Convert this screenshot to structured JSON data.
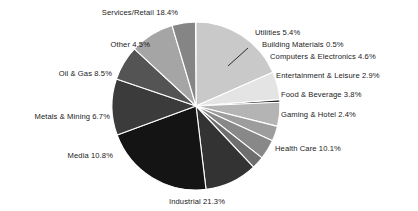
{
  "chart_data": {
    "type": "pie",
    "title": "",
    "subtitle": "",
    "xlabel": "",
    "ylabel": "",
    "legend_position": "none",
    "grid": false,
    "units": "percent",
    "total": 100.0,
    "categories": [
      "Services/Retail",
      "Utilities",
      "Building Materials",
      "Computers & Electronics",
      "Entertainment & Leisure",
      "Food & Beverage",
      "Gaming & Hotel",
      "Health Care",
      "Industrial",
      "Media",
      "Metals & Mining",
      "Oil & Gas",
      "Other"
    ],
    "values": [
      18.4,
      5.4,
      0.5,
      4.6,
      2.9,
      3.8,
      2.4,
      10.1,
      21.3,
      10.8,
      6.7,
      8.5,
      4.5
    ],
    "slices": [
      {
        "name": "Services/Retail",
        "value": 18.4,
        "label": "Services/Retail 18.4%",
        "color": "#c9c9c9",
        "start_angle": 0.0,
        "end_angle": 66.24,
        "label_x": 140,
        "label_y": 9,
        "label_align": "center",
        "leader": false
      },
      {
        "name": "Utilities",
        "value": 5.4,
        "label": "Utilities 5.4%",
        "color": "#e4e4e4",
        "start_angle": 66.24,
        "end_angle": 85.68,
        "label_x": 255,
        "label_y": 29,
        "label_align": "left",
        "leader": false
      },
      {
        "name": "Building Materials",
        "value": 0.5,
        "label": "Building Materials 0.5%",
        "color": "#2b2b2b",
        "start_angle": 85.68,
        "end_angle": 87.48,
        "label_x": 262,
        "label_y": 41,
        "label_align": "left",
        "leader": true
      },
      {
        "name": "Computers & Electronics",
        "value": 4.6,
        "label": "Computers & Electronics 4.6%",
        "color": "#b4b4b4",
        "start_angle": 87.48,
        "end_angle": 104.04,
        "label_x": 270,
        "label_y": 53,
        "label_align": "left",
        "leader": false
      },
      {
        "name": "Entertainment & Leisure",
        "value": 2.9,
        "label": "Entertainment & Leisure 2.9%",
        "color": "#9d9d9d",
        "start_angle": 104.04,
        "end_angle": 114.48,
        "label_x": 276,
        "label_y": 72,
        "label_align": "left",
        "leader": false
      },
      {
        "name": "Food & Beverage",
        "value": 3.8,
        "label": "Food & Beverage 3.8%",
        "color": "#888888",
        "start_angle": 114.48,
        "end_angle": 128.16,
        "label_x": 281,
        "label_y": 91,
        "label_align": "left",
        "leader": false
      },
      {
        "name": "Gaming & Hotel",
        "value": 2.4,
        "label": "Gaming & Hotel 2.4%",
        "color": "#6e6e6e",
        "start_angle": 128.16,
        "end_angle": 136.8,
        "label_x": 281,
        "label_y": 111,
        "label_align": "left",
        "leader": false
      },
      {
        "name": "Health Care",
        "value": 10.1,
        "label": "Health Care 10.1%",
        "color": "#333333",
        "start_angle": 136.8,
        "end_angle": 173.16,
        "label_x": 275,
        "label_y": 145,
        "label_align": "left",
        "leader": false
      },
      {
        "name": "Industrial",
        "value": 21.3,
        "label": "Industrial 21.3%",
        "color": "#141414",
        "start_angle": 173.16,
        "end_angle": 249.84,
        "label_x": 197,
        "label_y": 198,
        "label_align": "center",
        "leader": false
      },
      {
        "name": "Media",
        "value": 10.8,
        "label": "Media 10.8%",
        "color": "#3b3b3b",
        "start_angle": 249.84,
        "end_angle": 288.72,
        "label_x": 113,
        "label_y": 152,
        "label_align": "right",
        "leader": false
      },
      {
        "name": "Metals & Mining",
        "value": 6.7,
        "label": "Metals & Mining 6.7%",
        "color": "#545454",
        "start_angle": 288.72,
        "end_angle": 312.84,
        "label_x": 110,
        "label_y": 113,
        "label_align": "right",
        "leader": false
      },
      {
        "name": "Oil & Gas",
        "value": 8.5,
        "label": "Oil & Gas 8.5%",
        "color": "#a5a5a5",
        "start_angle": 312.84,
        "end_angle": 343.44,
        "label_x": 112,
        "label_y": 70,
        "label_align": "right",
        "leader": false
      },
      {
        "name": "Other",
        "value": 4.5,
        "label": "Other 4.5%",
        "color": "#858585",
        "start_angle": 343.44,
        "end_angle": 359.64,
        "label_x": 150,
        "label_y": 41,
        "label_align": "right",
        "leader": false
      }
    ],
    "geometry": {
      "center_x": 196,
      "center_y": 106,
      "radius": 84,
      "separator_color": "#ffffff",
      "separator_width": 1.1,
      "background": "#ffffff",
      "rotation_deg": 0
    },
    "leader_line": {
      "from_x": 248,
      "from_y": 48,
      "to_x": 228,
      "to_y": 66,
      "color": "#1a1a1a"
    }
  }
}
